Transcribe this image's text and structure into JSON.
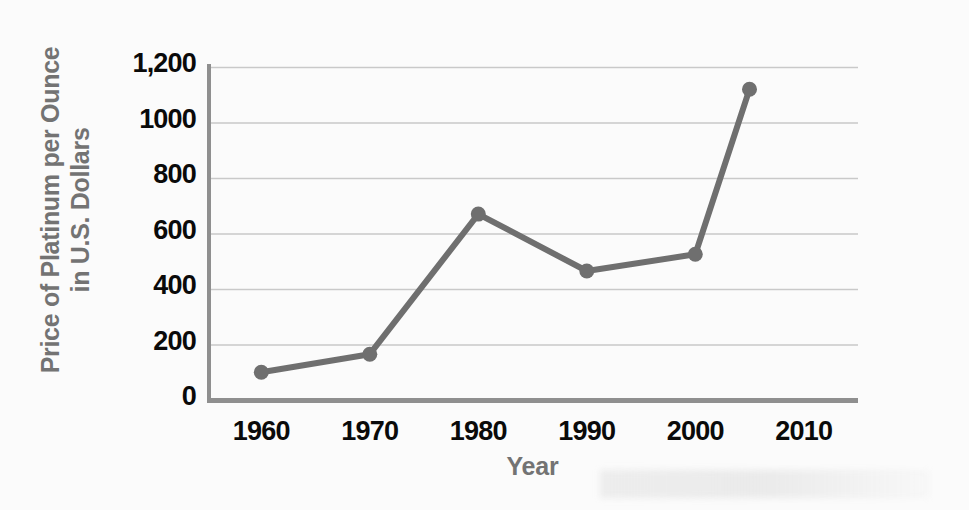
{
  "chart_data": {
    "type": "line",
    "title": "",
    "xlabel": "Year",
    "ylabel": "Price of Platinum per Ounce in U.S. Dollars",
    "ylabel_line1": "Price of Platinum per Ounce",
    "ylabel_line2": "in U.S. Dollars",
    "x": [
      1960,
      1970,
      1980,
      1990,
      2000,
      2005
    ],
    "values": [
      100,
      165,
      670,
      465,
      525,
      1120
    ],
    "series": [
      {
        "name": "Price of Platinum per Ounce in U.S. Dollars",
        "values": [
          100,
          165,
          670,
          465,
          525,
          1120
        ]
      }
    ],
    "x_tick_labels": [
      "1960",
      "1970",
      "1980",
      "1990",
      "2000",
      "2010"
    ],
    "x_tick_values": [
      1960,
      1970,
      1980,
      1990,
      2000,
      2010
    ],
    "y_tick_labels": [
      "1,200",
      "1000",
      "800",
      "600",
      "400",
      "200",
      "0"
    ],
    "y_tick_values": [
      1200,
      1000,
      800,
      600,
      400,
      200,
      0
    ],
    "xlim": [
      1955,
      2015
    ],
    "ylim": [
      0,
      1200
    ],
    "grid": "horizontal",
    "legend": "none",
    "marker": "circle",
    "colors": {
      "line": "#6f6f6f",
      "marker": "#6f6f6f",
      "gridline": "#c9c9c9",
      "axis": "#8a8a8a",
      "tick_label": "#0a0a0a",
      "axis_title": "#737373",
      "background": "#fbfbfb"
    }
  },
  "axis_titles": {
    "y_line1": "Price of Platinum per Ounce",
    "y_line2": "in U.S. Dollars",
    "x": "Year"
  }
}
